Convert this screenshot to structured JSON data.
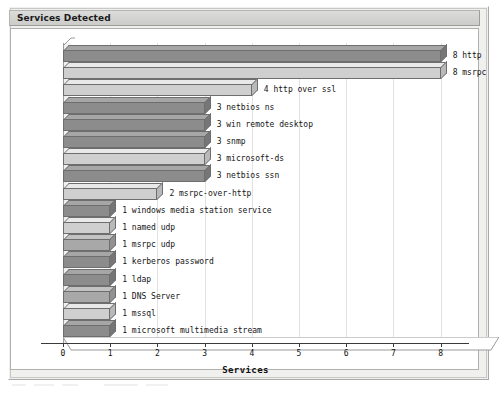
{
  "window": {
    "panel_title": "Services Detected"
  },
  "chart_data": {
    "type": "bar",
    "orientation": "horizontal",
    "title": "Services Detected",
    "xlabel": "Services",
    "ylabel": "",
    "xlim": [
      0,
      8.6
    ],
    "xticks": [
      0,
      1,
      2,
      3,
      4,
      5,
      6,
      7,
      8
    ],
    "grid": true,
    "legend": "none",
    "categories": [
      "http",
      "msrpc",
      "http over ssl",
      "netbios ns",
      "win remote desktop",
      "snmp",
      "microsoft-ds",
      "netbios ssn",
      "msrpc-over-http",
      "windows media station service",
      "named udp",
      "msrpc udp",
      "kerberos password",
      "ldap",
      "DNS Server",
      "mssql",
      "microsoft multimedia stream"
    ],
    "values": [
      8,
      8,
      4,
      3,
      3,
      3,
      3,
      3,
      2,
      1,
      1,
      1,
      1,
      1,
      1,
      1,
      1
    ],
    "bars": [
      {
        "label": "8 http",
        "value": 8,
        "shade": "dark"
      },
      {
        "label": "8 msrpc",
        "value": 8,
        "shade": "light"
      },
      {
        "label": "4 http over ssl",
        "value": 4,
        "shade": "light"
      },
      {
        "label": "3 netbios ns",
        "value": 3,
        "shade": "dark"
      },
      {
        "label": "3 win remote desktop",
        "value": 3,
        "shade": "dark"
      },
      {
        "label": "3 snmp",
        "value": 3,
        "shade": "dark"
      },
      {
        "label": "3 microsoft-ds",
        "value": 3,
        "shade": "light"
      },
      {
        "label": "3 netbios ssn",
        "value": 3,
        "shade": "dark"
      },
      {
        "label": "2 msrpc-over-http",
        "value": 2,
        "shade": "light"
      },
      {
        "label": "1 windows media station service",
        "value": 1,
        "shade": "dark"
      },
      {
        "label": "1 named udp",
        "value": 1,
        "shade": "light"
      },
      {
        "label": "1 msrpc udp",
        "value": 1,
        "shade": "mid"
      },
      {
        "label": "1 kerberos password",
        "value": 1,
        "shade": "dark"
      },
      {
        "label": "1 ldap",
        "value": 1,
        "shade": "dark"
      },
      {
        "label": "1 DNS Server",
        "value": 1,
        "shade": "mid"
      },
      {
        "label": "1 mssql",
        "value": 1,
        "shade": "light"
      },
      {
        "label": "1 microsoft multimedia stream",
        "value": 1,
        "shade": "dark"
      }
    ],
    "colors": {
      "bar_dark": "#8c8c8c",
      "bar_mid": "#a8a8a8",
      "bar_light": "#cfcfcf",
      "bar_outline": "#6e6e6e",
      "grid": "#e2e2e2",
      "axis": "#3a3a3a",
      "plot_bg": "#ffffff",
      "panel_bg": "#f0f0ef",
      "title_bg": "#d6d6d4"
    }
  }
}
